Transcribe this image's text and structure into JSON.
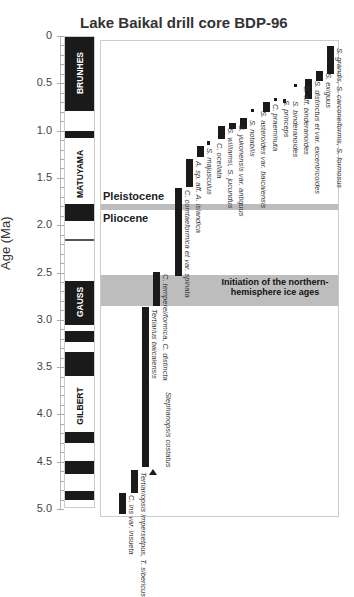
{
  "chart_data": {
    "type": "range-bar",
    "title": "Lake Baikal drill core BDP-96",
    "ylabel": "Age (Ma)",
    "xlabel": "",
    "ylim": [
      0,
      5.0
    ],
    "y_inverted": true,
    "yticks": [
      "0",
      "0.5",
      "1.0",
      "1.5",
      "2.0",
      "2.5",
      "3.0",
      "3.5",
      "4.0",
      "4.5",
      "5.0"
    ],
    "polarity_chrons": [
      {
        "name": "BRUNHES",
        "start": 0.0,
        "end": 0.78,
        "normal": true
      },
      {
        "name": "MATUYAMA",
        "start": 0.78,
        "end": 2.58,
        "normal": false
      },
      {
        "name": "GAUSS",
        "start": 2.58,
        "end": 3.58,
        "normal": true
      },
      {
        "name": "GILBERT",
        "start": 3.58,
        "end": 5.0,
        "normal": false
      }
    ],
    "normal_intervals": [
      [
        0.0,
        0.78
      ],
      [
        0.99,
        1.07
      ],
      [
        1.77,
        1.95
      ],
      [
        2.14,
        2.15
      ],
      [
        2.58,
        3.04
      ],
      [
        3.11,
        3.22
      ],
      [
        3.33,
        3.58
      ],
      [
        4.18,
        4.29
      ],
      [
        4.48,
        4.62
      ],
      [
        4.8,
        4.89
      ]
    ],
    "annotations": [
      {
        "text": "Pleistocene",
        "y": 1.7
      },
      {
        "text": "Pliocene",
        "y": 1.9
      },
      {
        "text": "Pleistocene/Pliocene boundary",
        "y": 1.8
      },
      {
        "text": "Initiation of the northern-hemisphere ice ages",
        "y_range": [
          2.5,
          2.8
        ]
      }
    ],
    "series": [
      {
        "name": "S. grandis, S. carconeiformis, S. formosus",
        "start": 0.1,
        "end": 0.39
      },
      {
        "name": "S. exiguus",
        "start": 0.36,
        "end": 0.47
      },
      {
        "name": "S. distinctus et var. excentricoides",
        "start": 0.44,
        "end": 0.66
      },
      {
        "name": "S. aff. binderanoides",
        "start": 0.5,
        "end": 0.53
      },
      {
        "name": "S. binderanoides",
        "start": 0.66,
        "end": 0.7
      },
      {
        "name": "S. princeps",
        "start": 0.65,
        "end": 0.68
      },
      {
        "name": "C. praeminuta",
        "start": 0.69,
        "end": 0.79
      },
      {
        "name": "S. asteroides var. baicalensis",
        "start": 0.76,
        "end": 0.79
      },
      {
        "name": "S. notabilis",
        "start": 0.86,
        "end": 0.97
      },
      {
        "name": "S. yukonensis var. antiquus",
        "start": 0.91,
        "end": 0.97
      },
      {
        "name": "S. williamsi, S. jucundus",
        "start": 0.94,
        "end": 1.08
      },
      {
        "name": "C. ocellata",
        "start": 1.1,
        "end": 1.14
      },
      {
        "name": "S. majusculus",
        "start": 1.15,
        "end": 1.27
      },
      {
        "name": "A. sp. aff. A. islandica",
        "start": 1.29,
        "end": 1.59
      },
      {
        "name": "C. comtaeformica et var. spinata",
        "start": 1.6,
        "end": 2.53
      },
      {
        "name": "C. temperei/formica, C. distincta",
        "start": 2.48,
        "end": 2.84
      },
      {
        "name": "Tertiarius baicalensis / Stephanopsis costatus",
        "start": 2.85,
        "end": 4.55
      },
      {
        "name": "Tertiariopsis impersetpus, T. sibericus",
        "start": 4.58,
        "end": 4.82
      },
      {
        "name": "C. ins var. insueta",
        "start": 4.82,
        "end": 5.04
      }
    ]
  },
  "labels": {
    "title": "Lake Baikal drill core BDP-96",
    "ylabel": "Age (Ma)",
    "pleistocene": "Pleistocene",
    "pliocene": "Pliocene",
    "ice_ages": "Initiation of the northern-hemisphere ice ages"
  }
}
